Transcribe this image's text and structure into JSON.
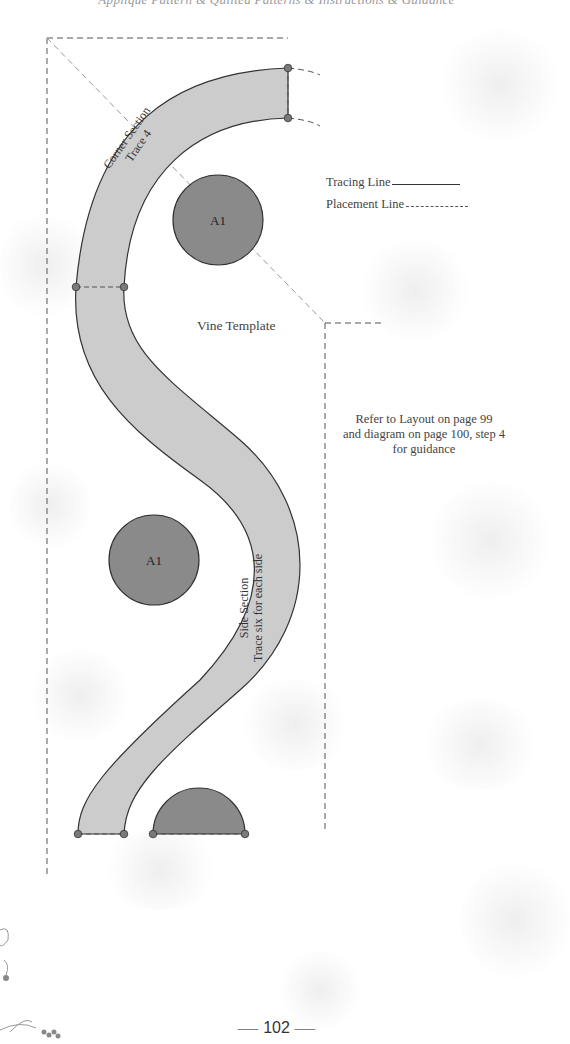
{
  "header": {
    "text": "Applique Pattern & Quilted Patterns & Instructions & Guidance"
  },
  "legend": {
    "tracing_line_label": "Tracing Line",
    "placement_line_label": "Placement Line"
  },
  "template": {
    "title": "Vine Template",
    "corner_section": {
      "line1": "Corner Section",
      "line2": "Trace 4"
    },
    "side_section": {
      "line1": "Side Section",
      "line2": "Trace six for each side"
    },
    "pieces": [
      {
        "label": "A1",
        "shape": "circle"
      },
      {
        "label": "A1",
        "shape": "circle"
      },
      {
        "label": "",
        "shape": "half-circle"
      }
    ],
    "colors": {
      "vine_fill": "#cccccc",
      "piece_fill": "#8a8a8a",
      "outline": "#333333",
      "dot_fill": "#7a7a7a",
      "dashed_line": "#555555"
    }
  },
  "guidance": {
    "line1": "Refer to Layout on page 99",
    "line2": "and diagram on page 100, step 4",
    "line3": "for guidance"
  },
  "footer": {
    "page_number": "102"
  }
}
